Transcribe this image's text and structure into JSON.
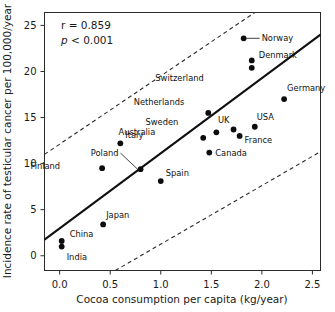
{
  "chart_data": {
    "type": "scatter",
    "title": "",
    "xlabel": "Cocoa consumption per capita (kg/year)",
    "ylabel": "Incidence rate of testicular cancer per 100,000/year",
    "xlim": [
      -0.15,
      2.58
    ],
    "ylim": [
      -1.6,
      26.4
    ],
    "xticks": [
      0.0,
      0.5,
      1.0,
      1.5,
      2.0,
      2.5
    ],
    "xtick_labels": [
      "0.0",
      "0.5",
      "1.0",
      "1.5",
      "2.0",
      "2.5"
    ],
    "yticks": [
      0,
      5,
      10,
      15,
      20,
      25
    ],
    "ytick_labels": [
      "0",
      "5",
      "10",
      "15",
      "20",
      "25"
    ],
    "grid": false,
    "legend": null,
    "annotations": [
      {
        "name": "correlation",
        "text": "r = 0.859"
      },
      {
        "name": "p-value",
        "text": "p < 0.001",
        "italic_prefix": "p"
      }
    ],
    "points": [
      {
        "label": "China",
        "x": 0.02,
        "y": 1.6,
        "label_dx": 8,
        "label_dy": -4
      },
      {
        "label": "India",
        "x": 0.02,
        "y": 1.0,
        "label_dx": 5,
        "label_dy": 13
      },
      {
        "label": "Japan",
        "x": 0.43,
        "y": 3.4,
        "label_dx": 3,
        "label_dy": -6
      },
      {
        "label": "Finland",
        "x": 0.42,
        "y": 9.5,
        "label_dx": -42,
        "label_dy": 1
      },
      {
        "label": "Poland",
        "x": 0.8,
        "y": 9.4,
        "label_dx": -22,
        "label_dy": -13,
        "leader": true
      },
      {
        "label": "Spain",
        "x": 1.0,
        "y": 8.1,
        "label_dx": 5,
        "label_dy": -5
      },
      {
        "label": "Italy",
        "x": 0.6,
        "y": 12.2,
        "label_dx": 5,
        "label_dy": -5
      },
      {
        "label": "Australia",
        "x": 1.42,
        "y": 12.8,
        "label_dx": -48,
        "label_dy": -3
      },
      {
        "label": "Sweden",
        "x": 1.55,
        "y": 13.4,
        "label_dx": -38,
        "label_dy": -7
      },
      {
        "label": "Netherlands",
        "x": 1.47,
        "y": 15.5,
        "label_dx": -24,
        "label_dy": -8
      },
      {
        "label": "Canada",
        "x": 1.48,
        "y": 11.2,
        "label_dx": 6,
        "label_dy": 3
      },
      {
        "label": "UK",
        "x": 1.72,
        "y": 13.7,
        "label_dx": -4,
        "label_dy": -7
      },
      {
        "label": "France",
        "x": 1.78,
        "y": 13.0,
        "label_dx": 5,
        "label_dy": 7
      },
      {
        "label": "USA",
        "x": 1.93,
        "y": 14.0,
        "label_dx": 2,
        "label_dy": -7
      },
      {
        "label": "Norway",
        "x": 1.82,
        "y": 23.6,
        "label_dx": 18,
        "label_dy": 3,
        "leader": true
      },
      {
        "label": "Denmark",
        "x": 1.9,
        "y": 21.2,
        "label_dx": 7,
        "label_dy": -2
      },
      {
        "label": "Switzerland",
        "x": 1.9,
        "y": 20.4,
        "label_dx": -48,
        "label_dy": 13
      },
      {
        "label": "Germany",
        "x": 2.22,
        "y": 17.0,
        "label_dx": 3,
        "label_dy": -8
      }
    ],
    "regression_line": {
      "name": "fit-line",
      "x1": -0.15,
      "y1": 1.75,
      "x2": 2.58,
      "y2": 24.0
    },
    "confidence_bands": [
      {
        "name": "upper-band",
        "x1": -0.15,
        "y1": 11.0,
        "x2": 1.93,
        "y2": 26.4
      },
      {
        "name": "lower-band",
        "x1": 0.55,
        "y1": -1.6,
        "x2": 2.58,
        "y2": 11.3
      }
    ]
  }
}
